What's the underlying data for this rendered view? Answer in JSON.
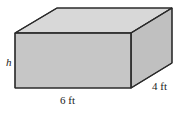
{
  "figure": {
    "type": "rectangular-prism-diagram",
    "labels": {
      "height": "h",
      "width": "6 ft",
      "depth": "4 ft"
    },
    "colors": {
      "front_face": "#c6c6c6",
      "top_face": "#d8d8d8",
      "side_face": "#c0c0c0",
      "outline": "#2b2b2b",
      "background": "#ffffff",
      "label_text": "#1a1a1a"
    },
    "geometry": {
      "front_top_left": [
        15,
        33
      ],
      "front_top_right": [
        131,
        33
      ],
      "front_bottom_left": [
        15,
        88
      ],
      "front_bottom_right": [
        131,
        88
      ],
      "back_top_left": [
        57,
        8
      ],
      "back_top_right": [
        172,
        8
      ],
      "back_bottom_right": [
        172,
        63
      ]
    },
    "measurements": {
      "width_value": 6,
      "depth_value": 4,
      "height_value": "h",
      "unit": "ft"
    }
  }
}
